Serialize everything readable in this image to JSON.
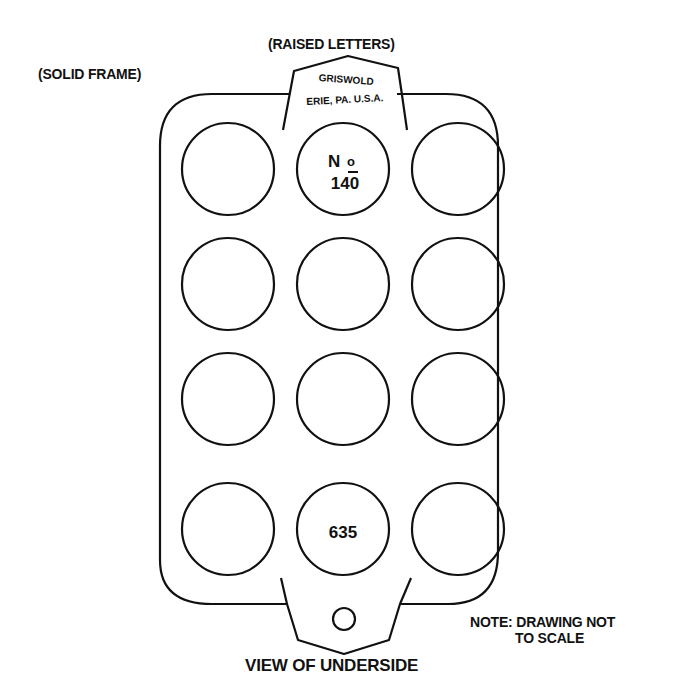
{
  "labels": {
    "raised_letters": "(RAISED LETTERS)",
    "solid_frame": "(SOLID FRAME)",
    "note_line1": "NOTE: DRAWING NOT",
    "note_line2": "TO SCALE",
    "caption": "VIEW OF UNDERSIDE"
  },
  "markings": {
    "maker": "GRISWOLD",
    "location": "ERIE, PA. U.S.A.",
    "number_prefix": "No",
    "model_number": "140",
    "pattern_number": "635"
  },
  "pan": {
    "rows": 4,
    "cols": 3,
    "cups": [
      {
        "row": 1,
        "col": 1,
        "text": ""
      },
      {
        "row": 1,
        "col": 2,
        "text": "No 140"
      },
      {
        "row": 1,
        "col": 3,
        "text": ""
      },
      {
        "row": 2,
        "col": 1,
        "text": ""
      },
      {
        "row": 2,
        "col": 2,
        "text": ""
      },
      {
        "row": 2,
        "col": 3,
        "text": ""
      },
      {
        "row": 3,
        "col": 1,
        "text": ""
      },
      {
        "row": 3,
        "col": 2,
        "text": ""
      },
      {
        "row": 3,
        "col": 3,
        "text": ""
      },
      {
        "row": 4,
        "col": 1,
        "text": ""
      },
      {
        "row": 4,
        "col": 2,
        "text": "635"
      },
      {
        "row": 4,
        "col": 3,
        "text": ""
      }
    ]
  },
  "colors": {
    "line": "#111111",
    "background": "#ffffff"
  }
}
